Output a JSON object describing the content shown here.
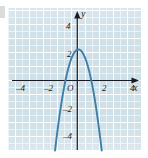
{
  "figure": {
    "type": "cartesian-graph",
    "background_color": "#cfe0e8",
    "gridline_color": "#ffffff",
    "axis_color": "#1a1a22",
    "curve_color": "#3e7fa8"
  },
  "axes": {
    "x_axis_label": "x",
    "y_axis_label": "y",
    "origin_label": "O",
    "x_ticks": [
      {
        "value": -4,
        "label": "–4"
      },
      {
        "value": -2,
        "label": "–2"
      },
      {
        "value": 2,
        "label": "2"
      },
      {
        "value": 4,
        "label": "4"
      }
    ],
    "y_ticks": [
      {
        "value": 4,
        "label": "4"
      },
      {
        "value": 2,
        "label": "2"
      },
      {
        "value": -2,
        "label": "–2"
      },
      {
        "value": -4,
        "label": "–4"
      }
    ]
  },
  "chart_data": {
    "type": "line",
    "title": "",
    "xlabel": "x",
    "ylabel": "y",
    "xlim": [
      -4.9,
      4.9
    ],
    "ylim": [
      -5.1,
      5.1
    ],
    "grid": true,
    "minor_grid_step": 0.5,
    "major_grid_step": 1,
    "legend": null,
    "series": [
      {
        "name": "parabola",
        "shape": "downward-opening parabola",
        "equation": "y = -2.6x^2 + 0.4x + 2.2",
        "vertex": [
          0.08,
          2.22
        ],
        "x_intercepts": [
          -1.45,
          1.15
        ],
        "y_intercept": 2.2,
        "color": "#3e7fa8",
        "x": [
          -1.95,
          -1.6,
          -1.2,
          -0.8,
          -0.4,
          0.08,
          0.5,
          0.9,
          1.3,
          1.7,
          2.05
        ],
        "values": [
          -6.46,
          -5.09,
          -2.02,
          0.22,
          1.62,
          2.22,
          1.75,
          0.45,
          -1.67,
          -4.64,
          -7.9
        ]
      }
    ]
  }
}
